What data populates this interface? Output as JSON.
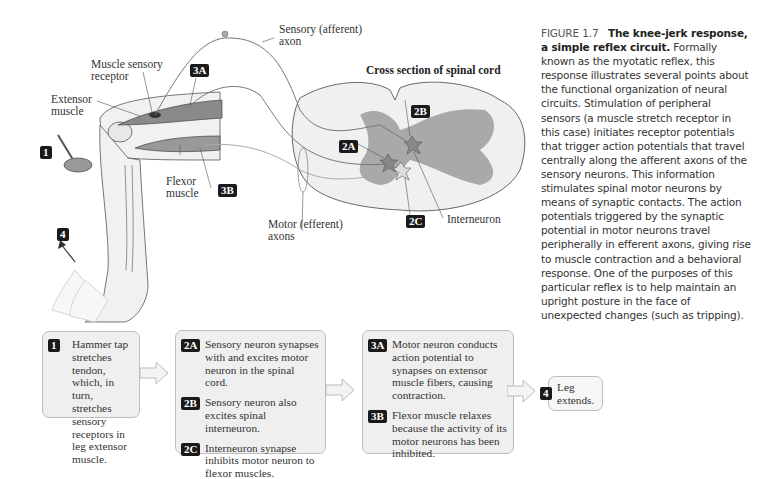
{
  "figure": {
    "number": "FIGURE 1.7",
    "title": "The knee-jerk response, a simple reflex circuit.",
    "caption": "Formally known as the myotatic reflex, this response illustrates several points about the functional organization of neural circuits. Stimulation of peripheral sensors (a muscle stretch receptor in this case) initiates receptor potentials that trigger action potentials that travel centrally along the afferent axons of the sensory neurons. This information stimulates spinal motor neurons by means of synaptic contacts. The action potentials triggered by the synaptic potential in motor neurons travel peripherally in efferent axons, giving rise to muscle contraction and a behavioral response. One of the purposes of this particular reflex is to help maintain an upright posture in the face of unexpected changes (such as tripping)."
  },
  "diagram": {
    "labels": {
      "sensory_axon_1": "Sensory (afferent)",
      "sensory_axon_2": "axon",
      "muscle_receptor_1": "Muscle sensory",
      "muscle_receptor_2": "receptor",
      "extensor_1": "Extensor",
      "extensor_2": "muscle",
      "flexor_1": "Flexor",
      "flexor_2": "muscle",
      "motor_axons_1": "Motor (efferent)",
      "motor_axons_2": "axons",
      "spinal_cord": "Cross section of spinal cord",
      "interneuron": "Interneuron"
    },
    "badges": {
      "b1": "1",
      "b2A": "2A",
      "b2B": "2B",
      "b2C": "2C",
      "b3A": "3A",
      "b3B": "3B",
      "b4": "4"
    },
    "colors": {
      "badge_bg": "#1a1a1a",
      "muscle": "#8a8a8a",
      "gray_matter": "#a9a9a9",
      "box_bg": "#efefef"
    }
  },
  "flow": {
    "box1": {
      "steps": [
        {
          "badge": "1",
          "text": "Hammer tap stretches tendon, which, in turn, stretches sensory receptors in leg extensor muscle."
        }
      ]
    },
    "box2": {
      "steps": [
        {
          "badge": "2A",
          "text": "Sensory neuron synapses with and excites motor neuron in the spinal cord."
        },
        {
          "badge": "2B",
          "text": "Sensory neuron also excites spinal interneuron."
        },
        {
          "badge": "2C",
          "text": "Interneuron synapse inhibits motor neuron to flexor muscles."
        }
      ]
    },
    "box3": {
      "steps": [
        {
          "badge": "3A",
          "text": "Motor neuron conducts action potential to synapses on extensor muscle fibers, causing contraction."
        },
        {
          "badge": "3B",
          "text": "Flexor muscle relaxes because the activity of its motor neurons has been inhibited."
        }
      ]
    },
    "box4": {
      "steps": [
        {
          "badge": "4",
          "text": "Leg extends."
        }
      ]
    }
  }
}
